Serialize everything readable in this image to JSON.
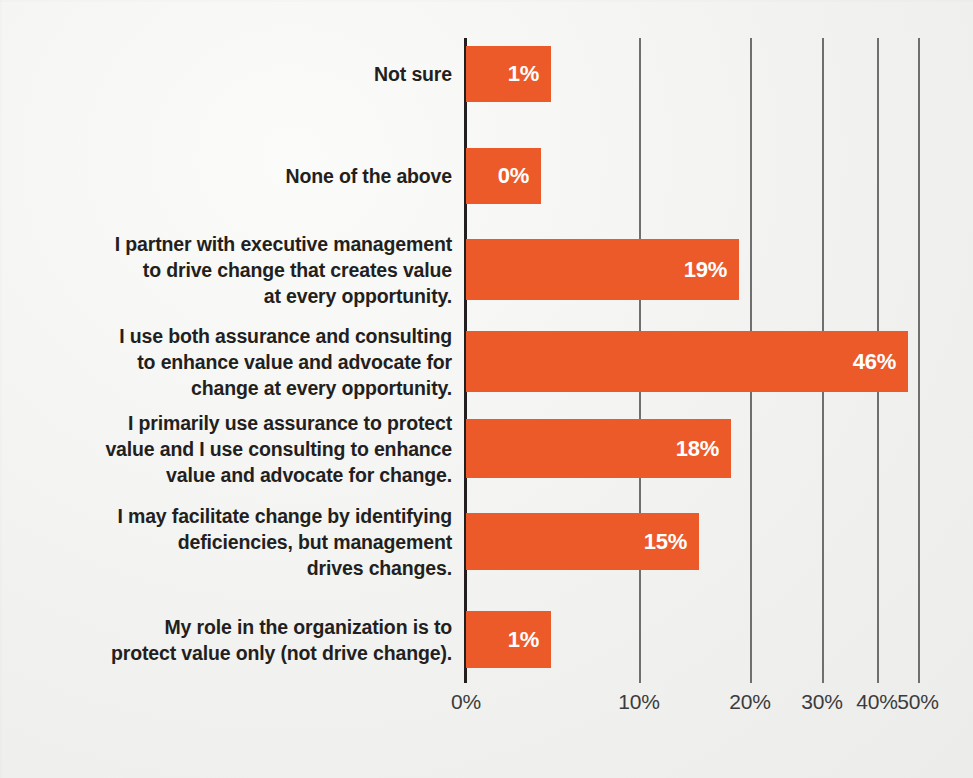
{
  "chart_data": {
    "type": "bar",
    "orientation": "horizontal",
    "title": "",
    "subtitle": "",
    "xlabel": "",
    "ylabel": "",
    "grid": true,
    "legend": null,
    "xlim": [
      0,
      50
    ],
    "axis_note": "non-uniform compressed x-axis; tick spacing decreases toward 50%",
    "tick_labels": [
      "0%",
      "10%",
      "20%",
      "30%",
      "40%",
      "50%"
    ],
    "tick_values": [
      0,
      10,
      20,
      30,
      40,
      50
    ],
    "tick_px": [
      466,
      639,
      750,
      822,
      877,
      918
    ],
    "categories": [
      "Not sure",
      "None of the above",
      "I partner with executive management\nto drive change that creates value\nat every opportunity.",
      "I use both assurance and consulting\nto enhance value and advocate for\nchange at every opportunity.",
      "I primarily use assurance to protect\nvalue and I use consulting to enhance\nvalue and advocate for change.",
      "I may facilitate change by identifying\ndeficiencies, but management\ndrives changes.",
      "My role in the organization is to\nprotect value only (not drive change)."
    ],
    "values": [
      1,
      0,
      19,
      46,
      18,
      15,
      1
    ],
    "value_labels": [
      "1%",
      "0%",
      "19%",
      "46%",
      "18%",
      "15%",
      "1%"
    ],
    "bar_end_px": [
      551,
      541,
      739,
      908,
      731,
      699,
      551
    ],
    "bar_top_px": [
      46,
      148,
      239,
      331,
      419,
      513,
      611
    ],
    "bar_height_px": [
      56,
      56,
      61,
      61,
      59,
      57,
      57
    ],
    "colors": {
      "bar": "#ec5a2a",
      "value_text": "#ffffff",
      "category_text": "#231f20",
      "tick_text": "#3b3b3b",
      "gridline": "#6f6f6f",
      "axis": "#231f20",
      "background": "#f2f2f0"
    }
  }
}
